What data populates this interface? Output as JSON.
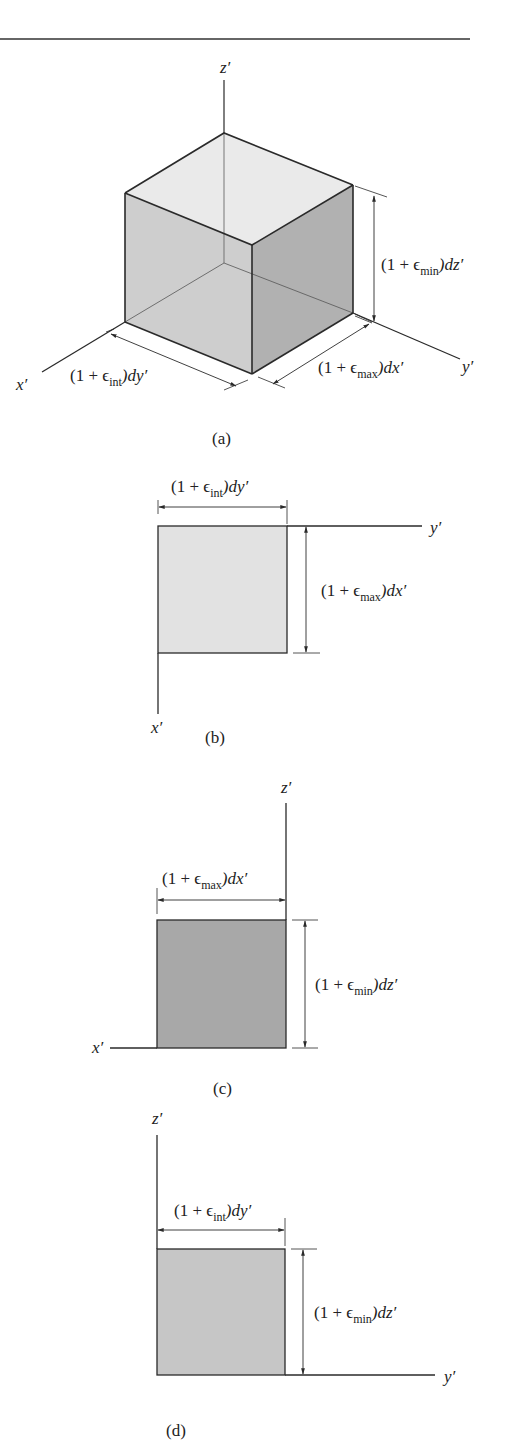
{
  "header": {
    "rule_color": "#666666"
  },
  "colors": {
    "line": "#2a2a2a",
    "face_top": "#e6e6e6",
    "face_left": "#c9c9c9",
    "face_right": "#a9a9a9",
    "panel_b_fill": "#e2e2e2",
    "panel_c_fill": "#a8a8a8",
    "panel_d_fill": "#c6c6c6"
  },
  "panels": {
    "a": {
      "caption": "(a)",
      "axes": {
        "x": "x′",
        "y": "y′",
        "z": "z′"
      },
      "dims": {
        "dy": {
          "pre": "(1 + ϵ",
          "sub": "int",
          "post": ")dy′"
        },
        "dx": {
          "pre": "(1 + ϵ",
          "sub": "max",
          "post": ")dx′"
        },
        "dz": {
          "pre": "(1 + ϵ",
          "sub": "min",
          "post": ")dz′"
        }
      }
    },
    "b": {
      "caption": "(b)",
      "axes": {
        "h": "y′",
        "v": "x′"
      },
      "dims": {
        "top": {
          "pre": "(1 + ϵ",
          "sub": "int",
          "post": ")dy′"
        },
        "side": {
          "pre": "(1 + ϵ",
          "sub": "max",
          "post": ")dx′"
        }
      }
    },
    "c": {
      "caption": "(c)",
      "axes": {
        "h": "x′",
        "v": "z′"
      },
      "dims": {
        "top": {
          "pre": "(1 + ϵ",
          "sub": "max",
          "post": ")dx′"
        },
        "side": {
          "pre": "(1 + ϵ",
          "sub": "min",
          "post": ")dz′"
        }
      }
    },
    "d": {
      "caption": "(d)",
      "axes": {
        "h": "y′",
        "v": "z′"
      },
      "dims": {
        "top": {
          "pre": "(1 + ϵ",
          "sub": "int",
          "post": ")dy′"
        },
        "side": {
          "pre": "(1 + ϵ",
          "sub": "min",
          "post": ")dz′"
        }
      }
    }
  }
}
